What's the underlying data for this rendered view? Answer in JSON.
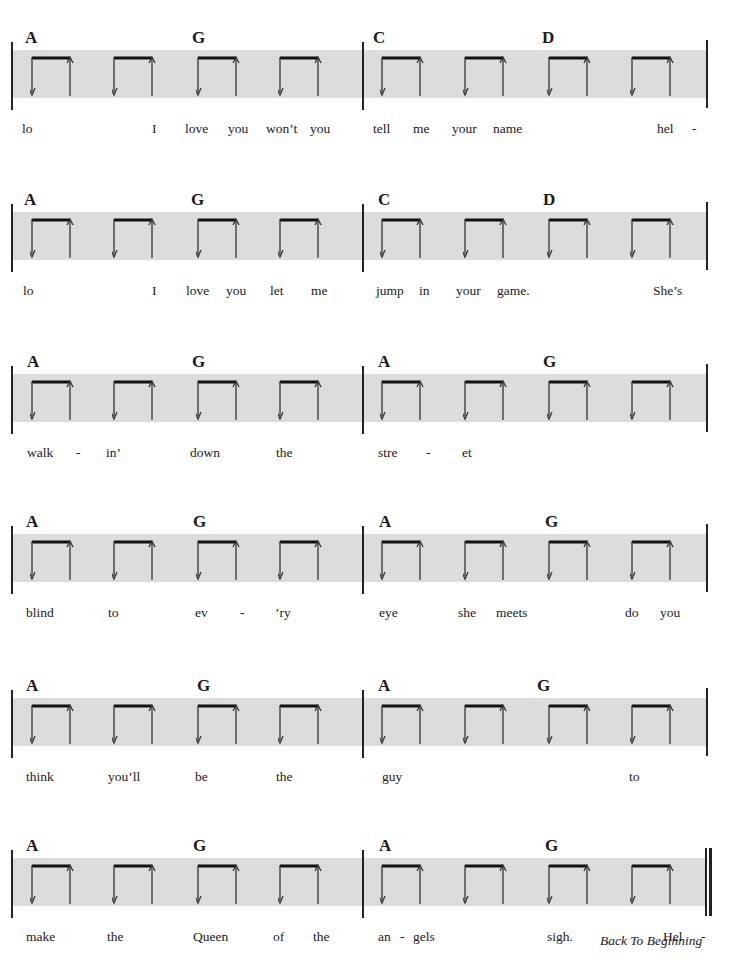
{
  "page": {
    "type": "strum-pattern sheet music with lyrics"
  },
  "colors": {
    "band": "#dcdcdc",
    "ink": "#1a1a1a"
  },
  "strum_icon": "down-up-strum-bracket-icon",
  "systems": [
    {
      "top": 28,
      "chords": [
        {
          "label": "A",
          "x": 25
        },
        {
          "label": "G",
          "x": 192
        },
        {
          "label": "C",
          "x": 373
        },
        {
          "label": "D",
          "x": 542
        }
      ],
      "lyrics": [
        {
          "text": "lo",
          "x": 22
        },
        {
          "text": "I",
          "x": 152
        },
        {
          "text": "love",
          "x": 185
        },
        {
          "text": "you",
          "x": 228
        },
        {
          "text": "won’t",
          "x": 266
        },
        {
          "text": "you",
          "x": 310
        },
        {
          "text": "tell",
          "x": 373
        },
        {
          "text": "me",
          "x": 413
        },
        {
          "text": "your",
          "x": 452
        },
        {
          "text": "name",
          "x": 493
        },
        {
          "text": "hel",
          "x": 657
        },
        {
          "text": "-",
          "x": 692
        }
      ]
    },
    {
      "top": 190,
      "chords": [
        {
          "label": "A",
          "x": 24
        },
        {
          "label": "G",
          "x": 191
        },
        {
          "label": "C",
          "x": 378
        },
        {
          "label": "D",
          "x": 543
        }
      ],
      "lyrics": [
        {
          "text": "lo",
          "x": 23
        },
        {
          "text": "I",
          "x": 152
        },
        {
          "text": "love",
          "x": 186
        },
        {
          "text": "you",
          "x": 226
        },
        {
          "text": "let",
          "x": 270
        },
        {
          "text": "me",
          "x": 311
        },
        {
          "text": "jump",
          "x": 376
        },
        {
          "text": "in",
          "x": 419
        },
        {
          "text": "your",
          "x": 456
        },
        {
          "text": "game.",
          "x": 497
        },
        {
          "text": "She’s",
          "x": 653
        }
      ]
    },
    {
      "top": 352,
      "chords": [
        {
          "label": "A",
          "x": 27
        },
        {
          "label": "G",
          "x": 192
        },
        {
          "label": "A",
          "x": 378
        },
        {
          "label": "G",
          "x": 543
        }
      ],
      "lyrics": [
        {
          "text": "walk",
          "x": 27
        },
        {
          "text": "-",
          "x": 76
        },
        {
          "text": "in’",
          "x": 106
        },
        {
          "text": "down",
          "x": 190
        },
        {
          "text": "the",
          "x": 276
        },
        {
          "text": "stre",
          "x": 378
        },
        {
          "text": "-",
          "x": 426
        },
        {
          "text": "et",
          "x": 462
        }
      ]
    },
    {
      "top": 512,
      "chords": [
        {
          "label": "A",
          "x": 26
        },
        {
          "label": "G",
          "x": 193
        },
        {
          "label": "A",
          "x": 379
        },
        {
          "label": "G",
          "x": 545
        }
      ],
      "lyrics": [
        {
          "text": "blind",
          "x": 26
        },
        {
          "text": "to",
          "x": 108
        },
        {
          "text": "ev",
          "x": 195
        },
        {
          "text": "-",
          "x": 240
        },
        {
          "text": "’ry",
          "x": 275
        },
        {
          "text": "eye",
          "x": 379
        },
        {
          "text": "she",
          "x": 458
        },
        {
          "text": "meets",
          "x": 496
        },
        {
          "text": "do",
          "x": 625
        },
        {
          "text": "you",
          "x": 660
        }
      ]
    },
    {
      "top": 676,
      "chords": [
        {
          "label": "A",
          "x": 26
        },
        {
          "label": "G",
          "x": 197
        },
        {
          "label": "A",
          "x": 378
        },
        {
          "label": "G",
          "x": 537
        }
      ],
      "lyrics": [
        {
          "text": "think",
          "x": 26
        },
        {
          "text": "you’ll",
          "x": 108
        },
        {
          "text": "be",
          "x": 195
        },
        {
          "text": "the",
          "x": 276
        },
        {
          "text": "guy",
          "x": 382
        },
        {
          "text": "to",
          "x": 629
        }
      ]
    },
    {
      "top": 836,
      "chords": [
        {
          "label": "A",
          "x": 26
        },
        {
          "label": "G",
          "x": 193
        },
        {
          "label": "A",
          "x": 379
        },
        {
          "label": "G",
          "x": 545
        }
      ],
      "lyrics": [
        {
          "text": "make",
          "x": 26
        },
        {
          "text": "the",
          "x": 107
        },
        {
          "text": "Queen",
          "x": 193
        },
        {
          "text": "of",
          "x": 273
        },
        {
          "text": "the",
          "x": 313
        },
        {
          "text": "an",
          "x": 378
        },
        {
          "text": "-",
          "x": 400
        },
        {
          "text": "gels",
          "x": 413
        },
        {
          "text": "sigh.",
          "x": 547
        },
        {
          "text": "Hel",
          "x": 663
        },
        {
          "text": "-",
          "x": 701
        }
      ],
      "final": true
    }
  ],
  "strum_positions": [
    30,
    112,
    196,
    278,
    380,
    463,
    547,
    630
  ],
  "footer": {
    "back_to_beginning": "Back To Beginning"
  }
}
